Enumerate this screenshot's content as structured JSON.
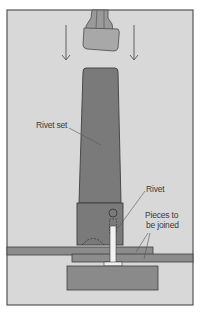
{
  "figure": {
    "colors": {
      "background": "#d8d8d8",
      "frame": "#555555",
      "rivet_set": "#7a7a7a",
      "hammer": "#a8a8a8",
      "plates": "#8c8c8c",
      "anvil": "#8a8a8a",
      "rivet": "#f2f2f2",
      "outline": "#4a4a4a"
    }
  },
  "labels": {
    "rivet_set": "Rivet set",
    "rivet": "Rivet",
    "pieces_line1": "Pieces to",
    "pieces_line2": "be joined"
  },
  "arrows": {
    "count": 2,
    "direction": "down"
  }
}
